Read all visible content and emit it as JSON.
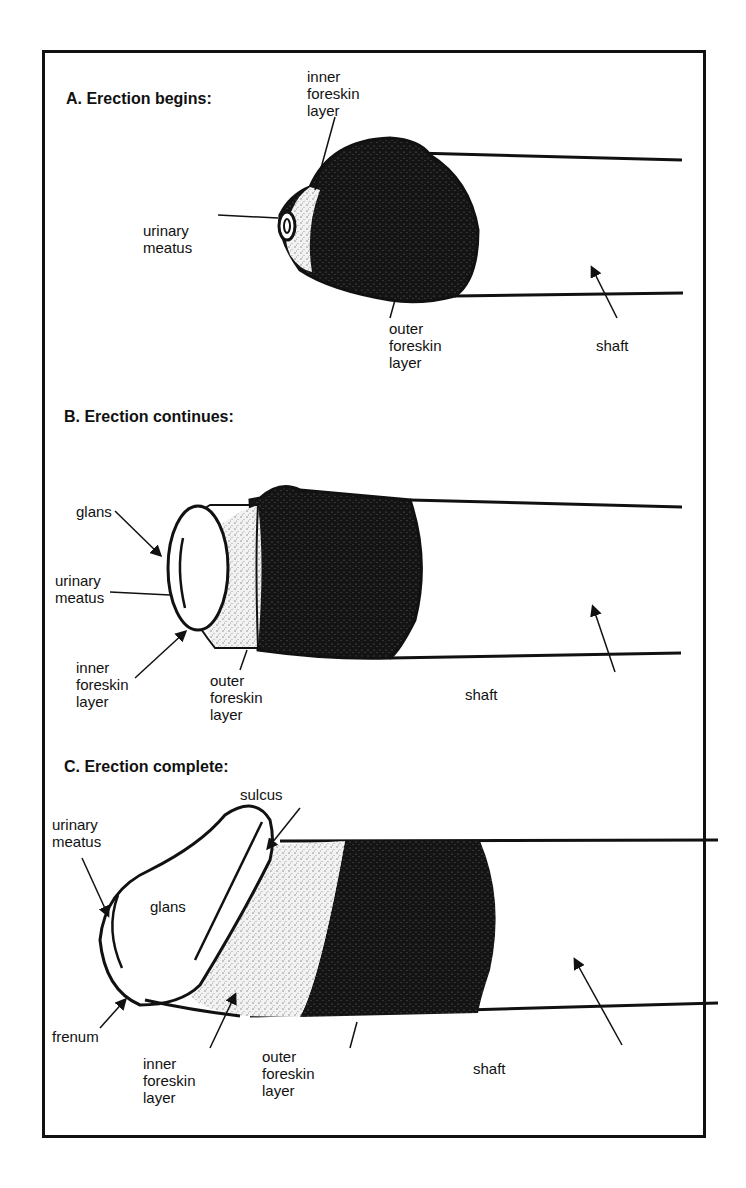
{
  "figure": {
    "panels": [
      {
        "title": "A. Erection begins:",
        "labels": {
          "inner_foreskin": "inner\nforeskin\nlayer",
          "urinary_meatus": "urinary\nmeatus",
          "outer_foreskin": "outer\nforeskin\nlayer",
          "shaft": "shaft"
        }
      },
      {
        "title": "B. Erection continues:",
        "labels": {
          "glans": "glans",
          "urinary_meatus": "urinary\nmeatus",
          "inner_foreskin": "inner\nforeskin\nlayer",
          "outer_foreskin": "outer\nforeskin\nlayer",
          "shaft": "shaft"
        }
      },
      {
        "title": "C. Erection complete:",
        "labels": {
          "sulcus": "sulcus",
          "urinary_meatus": "urinary\nmeatus",
          "glans": "glans",
          "frenum": "frenum",
          "inner_foreskin": "inner\nforeskin\nlayer",
          "outer_foreskin": "outer\nforeskin\nlayer",
          "shaft": "shaft"
        }
      }
    ],
    "colors": {
      "ink": "#111111",
      "stipple_light": "#d8d8d8",
      "stipple_dark": "#1a1a1a",
      "background": "#ffffff"
    }
  }
}
